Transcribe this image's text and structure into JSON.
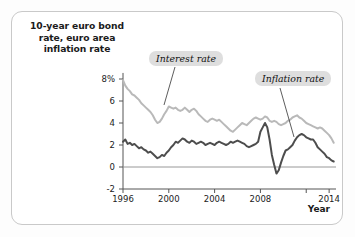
{
  "card": {
    "y_axis_title_lines": [
      "10-year euro bond",
      "rate, euro area",
      "inflation rate"
    ],
    "x_axis_name": "Year"
  },
  "annotations": [
    {
      "name": "interest-rate-callout",
      "text": "Interest rate"
    },
    {
      "name": "inflation-rate-callout",
      "text": "Inflation rate"
    }
  ],
  "chart_data": {
    "type": "line",
    "title": "",
    "subtitle": "",
    "xlabel": "Year",
    "ylabel": "10-year euro bond rate, euro area inflation rate",
    "xlim": [
      1996,
      2014.6
    ],
    "ylim": [
      -2,
      9
    ],
    "grid": false,
    "legend_position": "inline-callouts",
    "y_tick_labels": [
      "8%",
      "6",
      "4",
      "2",
      "0",
      "-2"
    ],
    "y_ticks": [
      8,
      6,
      4,
      2,
      0,
      -2
    ],
    "x_tick_labels": [
      "1996",
      "2000",
      "2004",
      "2008",
      "2014"
    ],
    "x_ticks": [
      1996,
      2000,
      2004,
      2008,
      2014
    ],
    "x_unlabeled_ticks": [
      2012
    ],
    "zero_line": 0,
    "colors": {
      "interest_rate_line": "#b9b9b9",
      "inflation_rate_line": "#4d4d4d",
      "axis": "#555555",
      "callout_background": "#dedede",
      "card_border": "#c9c9c9"
    },
    "series": [
      {
        "name": "Interest rate",
        "label": "Interest rate",
        "color": "#b9b9b9",
        "x": [
          1996.0,
          1996.2,
          1996.4,
          1996.6,
          1996.8,
          1997.0,
          1997.2,
          1997.4,
          1997.6,
          1997.8,
          1998.0,
          1998.2,
          1998.4,
          1998.6,
          1998.8,
          1999.0,
          1999.2,
          1999.4,
          1999.6,
          1999.8,
          2000.0,
          2000.2,
          2000.4,
          2000.6,
          2000.8,
          2001.0,
          2001.2,
          2001.4,
          2001.6,
          2001.8,
          2002.0,
          2002.2,
          2002.4,
          2002.6,
          2002.8,
          2003.0,
          2003.2,
          2003.4,
          2003.6,
          2003.8,
          2004.0,
          2004.2,
          2004.4,
          2004.6,
          2004.8,
          2005.0,
          2005.2,
          2005.4,
          2005.6,
          2005.8,
          2006.0,
          2006.2,
          2006.4,
          2006.6,
          2006.8,
          2007.0,
          2007.2,
          2007.4,
          2007.6,
          2007.8,
          2008.0,
          2008.2,
          2008.4,
          2008.6,
          2008.8,
          2009.0,
          2009.2,
          2009.4,
          2009.6,
          2009.8,
          2010.0,
          2010.2,
          2010.4,
          2010.6,
          2010.8,
          2011.0,
          2011.2,
          2011.4,
          2011.6,
          2011.8,
          2012.0,
          2012.2,
          2012.4,
          2012.6,
          2012.8,
          2013.0,
          2013.2,
          2013.4,
          2013.6,
          2013.8,
          2014.0,
          2014.2,
          2014.4
        ],
        "values": [
          7.9,
          7.4,
          7.1,
          6.9,
          6.6,
          6.5,
          6.3,
          6.1,
          5.8,
          5.6,
          5.4,
          5.2,
          5.0,
          4.7,
          4.3,
          4.0,
          4.1,
          4.4,
          4.8,
          5.1,
          5.5,
          5.4,
          5.3,
          5.4,
          5.2,
          5.1,
          5.2,
          5.4,
          5.2,
          5.0,
          5.2,
          5.3,
          5.1,
          4.8,
          4.6,
          4.4,
          4.2,
          4.1,
          4.3,
          4.4,
          4.3,
          4.2,
          4.3,
          4.1,
          3.9,
          3.7,
          3.5,
          3.3,
          3.2,
          3.4,
          3.6,
          3.8,
          4.0,
          3.9,
          3.8,
          4.0,
          4.2,
          4.4,
          4.5,
          4.4,
          4.3,
          4.4,
          4.6,
          4.5,
          4.2,
          4.1,
          4.2,
          4.1,
          3.9,
          3.8,
          3.9,
          4.0,
          4.2,
          4.3,
          4.5,
          4.6,
          4.7,
          4.5,
          4.4,
          4.2,
          4.0,
          3.9,
          3.8,
          3.7,
          3.6,
          3.5,
          3.6,
          3.5,
          3.3,
          3.1,
          2.9,
          2.6,
          2.2
        ]
      },
      {
        "name": "Inflation rate",
        "label": "Inflation rate",
        "color": "#4d4d4d",
        "x": [
          1996.0,
          1996.2,
          1996.4,
          1996.6,
          1996.8,
          1997.0,
          1997.2,
          1997.4,
          1997.6,
          1997.8,
          1998.0,
          1998.2,
          1998.4,
          1998.6,
          1998.8,
          1999.0,
          1999.2,
          1999.4,
          1999.6,
          1999.8,
          2000.0,
          2000.2,
          2000.4,
          2000.6,
          2000.8,
          2001.0,
          2001.2,
          2001.4,
          2001.6,
          2001.8,
          2002.0,
          2002.2,
          2002.4,
          2002.6,
          2002.8,
          2003.0,
          2003.2,
          2003.4,
          2003.6,
          2003.8,
          2004.0,
          2004.2,
          2004.4,
          2004.6,
          2004.8,
          2005.0,
          2005.2,
          2005.4,
          2005.6,
          2005.8,
          2006.0,
          2006.2,
          2006.4,
          2006.6,
          2006.8,
          2007.0,
          2007.2,
          2007.4,
          2007.6,
          2007.8,
          2008.0,
          2008.2,
          2008.4,
          2008.6,
          2008.8,
          2009.0,
          2009.2,
          2009.4,
          2009.6,
          2009.8,
          2010.0,
          2010.2,
          2010.4,
          2010.6,
          2010.8,
          2011.0,
          2011.2,
          2011.4,
          2011.6,
          2011.8,
          2012.0,
          2012.2,
          2012.4,
          2012.6,
          2012.8,
          2013.0,
          2013.2,
          2013.4,
          2013.6,
          2013.8,
          2014.0,
          2014.2,
          2014.4
        ],
        "values": [
          2.3,
          2.5,
          2.1,
          2.2,
          2.0,
          2.1,
          1.9,
          1.7,
          1.8,
          1.6,
          1.5,
          1.3,
          1.4,
          1.2,
          1.0,
          0.8,
          0.9,
          1.1,
          1.0,
          1.3,
          1.5,
          1.8,
          2.0,
          2.3,
          2.2,
          2.4,
          2.6,
          2.5,
          2.3,
          2.2,
          2.4,
          2.3,
          2.1,
          2.2,
          2.3,
          2.2,
          2.0,
          2.1,
          2.2,
          2.1,
          2.0,
          2.2,
          2.3,
          2.2,
          2.1,
          2.0,
          2.1,
          2.3,
          2.2,
          2.3,
          2.4,
          2.3,
          2.2,
          2.1,
          1.9,
          1.8,
          1.9,
          2.0,
          2.1,
          2.3,
          3.2,
          3.6,
          4.0,
          3.6,
          2.5,
          1.1,
          0.2,
          -0.6,
          -0.3,
          0.4,
          1.0,
          1.5,
          1.6,
          1.8,
          2.0,
          2.4,
          2.7,
          2.9,
          3.0,
          2.9,
          2.7,
          2.6,
          2.5,
          2.5,
          2.2,
          1.8,
          1.6,
          1.4,
          1.2,
          0.9,
          0.8,
          0.6,
          0.5
        ]
      }
    ]
  }
}
